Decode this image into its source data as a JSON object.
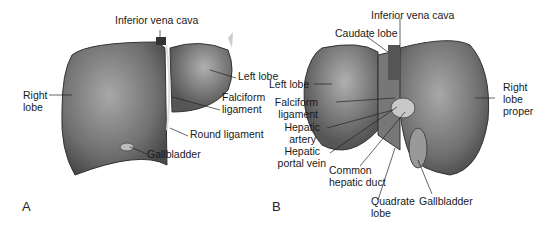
{
  "figure": {
    "panel_a": {
      "letter": "A",
      "labels": {
        "ivc": "Inferior vena cava",
        "left_lobe": "Left lobe",
        "right_lobe_1": "Right",
        "right_lobe_2": "lobe",
        "falciform_1": "Falciform",
        "falciform_2": "ligament",
        "round_ligament": "Round ligament",
        "gallbladder": "Gallbladder"
      }
    },
    "panel_b": {
      "letter": "B",
      "labels": {
        "ivc": "Inferior vena cava",
        "caudate": "Caudate lobe",
        "left_lobe": "Left lobe",
        "falciform_1": "Falciform",
        "falciform_2": "ligament",
        "hepatic_artery_1": "Hepatic",
        "hepatic_artery_2": "artery",
        "portal_vein_1": "Hepatic",
        "portal_vein_2": "portal vein",
        "common_duct_1": "Common",
        "common_duct_2": "hepatic duct",
        "quadrate_1": "Quadrate",
        "quadrate_2": "lobe",
        "gallbladder": "Gallbladder",
        "right_lobe_1": "Right",
        "right_lobe_2": "lobe",
        "right_lobe_3": "proper"
      }
    }
  }
}
